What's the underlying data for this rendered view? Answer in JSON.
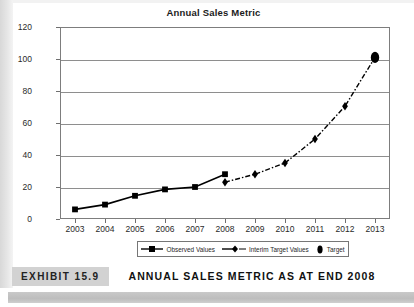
{
  "chart_data": {
    "type": "line",
    "title": "Annual Sales Metric",
    "xlabel": "",
    "ylabel": "",
    "x": [
      2003,
      2004,
      2005,
      2006,
      2007,
      2008,
      2009,
      2010,
      2011,
      2012,
      2013
    ],
    "categories": [
      "2003",
      "2004",
      "2005",
      "2006",
      "2007",
      "2008",
      "2009",
      "2010",
      "2011",
      "2012",
      "2013"
    ],
    "xlim": [
      2002.5,
      2013.5
    ],
    "ylim": [
      0,
      120
    ],
    "yticks": [
      0,
      20,
      40,
      60,
      80,
      100,
      120
    ],
    "ytick_labels": [
      "0",
      "20",
      "40",
      "60",
      "80",
      "100",
      "120"
    ],
    "grid": "horizontal",
    "legend_position": "bottom",
    "series": [
      {
        "name": "Observed Values",
        "marker": "square",
        "line_style": "solid",
        "color": "#000000",
        "x": [
          2003,
          2004,
          2005,
          2006,
          2007,
          2008
        ],
        "values": [
          6,
          9,
          14.5,
          18.5,
          20,
          28
        ]
      },
      {
        "name": "Interim Target Values",
        "marker": "diamond",
        "line_style": "dash-dot",
        "color": "#000000",
        "x": [
          2008,
          2009,
          2010,
          2011,
          2012,
          2013
        ],
        "values": [
          23,
          28,
          35,
          50,
          70.5,
          101
        ]
      },
      {
        "name": "Target",
        "marker": "ellipse",
        "line_style": "none",
        "color": "#000000",
        "x": [
          2013
        ],
        "values": [
          101
        ]
      }
    ]
  },
  "legend": {
    "items": [
      {
        "label": "Observed Values"
      },
      {
        "label": "Interim Target Values"
      },
      {
        "label": "Target"
      }
    ]
  },
  "caption": {
    "exhibit_number": "EXHIBIT 15.9",
    "exhibit_title": "ANNUAL SALES METRIC AS AT END 2008"
  },
  "colors": {
    "ink": "#000000",
    "grid": "#8e8e8e",
    "frame": "#7d7d7d",
    "caption_box": "#d2d2d2",
    "bottom_bar": "#c4c4c4"
  }
}
